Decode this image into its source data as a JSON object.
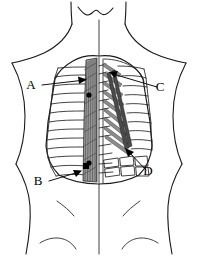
{
  "figure": {
    "title": "Posterior trunk musculature diagram",
    "view": "posterior",
    "width": 203,
    "height": 256,
    "background_color": "#ffffff",
    "line_color": "#1a1a1a"
  },
  "labels": [
    {
      "id": "A",
      "text": "A",
      "side": "left",
      "text_x": 31,
      "text_y": 89,
      "leader_from_x": 42,
      "leader_from_y": 85,
      "leader_to_x": 85,
      "leader_to_y": 80,
      "arrow_x": 86,
      "arrow_y": 80,
      "arrow_angle": -8
    },
    {
      "id": "B",
      "text": "B",
      "side": "left",
      "text_x": 38,
      "text_y": 185,
      "leader_from_x": 49,
      "leader_from_y": 181,
      "leader_to_x": 80,
      "leader_to_y": 172,
      "arrow_x": 81,
      "arrow_y": 172,
      "arrow_angle": -18
    },
    {
      "id": "C",
      "text": "C",
      "side": "right",
      "text_x": 160,
      "text_y": 91,
      "leader_from_x": 157,
      "leader_from_y": 87,
      "leader_to_x": 111,
      "leader_to_y": 73,
      "arrow_x": 110,
      "arrow_y": 73,
      "arrow_angle": 196
    },
    {
      "id": "D",
      "text": "D",
      "side": "right",
      "text_x": 148,
      "text_y": 175,
      "leader_from_x": 146,
      "leader_from_y": 170,
      "leader_to_x": 127,
      "leader_to_y": 151,
      "arrow_x": 126,
      "arrow_y": 150,
      "arrow_angle": 218
    }
  ],
  "markers": {
    "dots": [
      {
        "name": "dot-upper-left",
        "x": 89,
        "y": 95,
        "r": 2.6
      },
      {
        "name": "dot-lower-left",
        "x": 89,
        "y": 163,
        "r": 2.6
      }
    ]
  },
  "anatomy": {
    "left_panel_name": "horizontal rib and intercostal layer",
    "right_panel_name": "oblique levator costae fiber layer",
    "center_name": "vertebral column",
    "left_rib_count": 12,
    "right_fiber_count": 11
  }
}
